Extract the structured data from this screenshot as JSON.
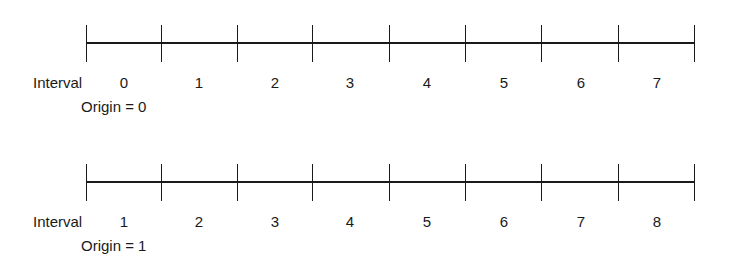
{
  "diagrams": [
    {
      "interval_label": "Interval",
      "origin_label": "Origin = 0",
      "origin": 0,
      "intervals": [
        "0",
        "1",
        "2",
        "3",
        "4",
        "5",
        "6",
        "7"
      ]
    },
    {
      "interval_label": "Interval",
      "origin_label": "Origin = 1",
      "origin": 1,
      "intervals": [
        "1",
        "2",
        "3",
        "4",
        "5",
        "6",
        "7",
        "8"
      ]
    }
  ],
  "colors": {
    "line": "#1a1a1a",
    "background": "#ffffff"
  }
}
